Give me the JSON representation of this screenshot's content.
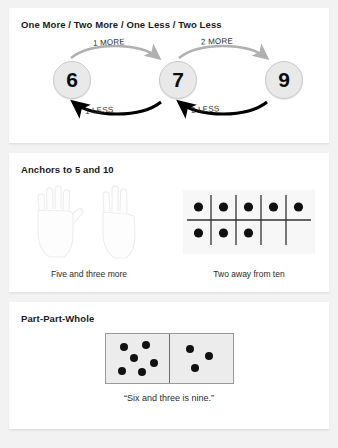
{
  "panels": {
    "more_less": {
      "title": "One More / Two More / One Less / Two Less",
      "nodes": [
        {
          "value": "6"
        },
        {
          "value": "7"
        },
        {
          "value": "9"
        }
      ],
      "arrows": [
        {
          "label": "1 MORE",
          "direction": "right",
          "color": "#b0b0b0"
        },
        {
          "label": "2 MORE",
          "direction": "right",
          "color": "#b0b0b0"
        },
        {
          "label": "1 LESS",
          "direction": "left",
          "color": "#000000"
        },
        {
          "label": "2 LESS",
          "direction": "left",
          "color": "#000000"
        }
      ]
    },
    "anchors": {
      "title": "Anchors to 5 and 10",
      "hands_caption": "Five and three more",
      "frame_caption": "Two away from ten",
      "hands": [
        {
          "name": "open-hand-five",
          "fingers_up": 5
        },
        {
          "name": "hand-three",
          "fingers_up": 3
        }
      ],
      "ten_frame": {
        "columns": 5,
        "rows": 2,
        "filled": 8,
        "top_row": [
          1,
          1,
          1,
          1,
          1
        ],
        "bottom_row": [
          1,
          1,
          1,
          0,
          0
        ]
      }
    },
    "part_part_whole": {
      "title": "Part-Part-Whole",
      "caption": "“Six and three is nine.”",
      "domino": {
        "left_pips": 6,
        "right_pips": 3,
        "total": 9
      }
    }
  },
  "colors": {
    "page_background": "#f2f2f2",
    "card_background": "#ffffff",
    "circle_fill": "#e9e9e9",
    "pip": "#111111",
    "more_arrow": "#b0b0b0",
    "less_arrow": "#000000"
  }
}
